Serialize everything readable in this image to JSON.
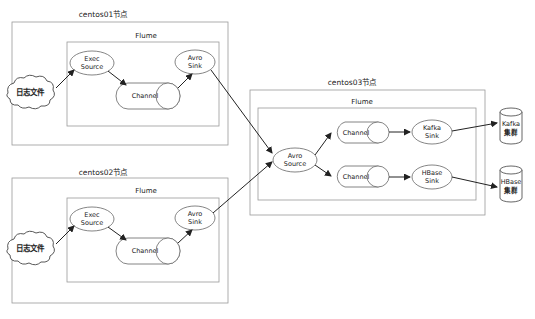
{
  "nodes": {
    "centos01": {
      "title": "centos01节点",
      "flume": "Flume",
      "log": "日志文件",
      "source": [
        "Exec",
        "Source"
      ],
      "channel": "Channel",
      "sink": [
        "Avro",
        "Sink"
      ]
    },
    "centos02": {
      "title": "centos02节点",
      "flume": "Flume",
      "log": "日志文件",
      "source": [
        "Exec",
        "Source"
      ],
      "channel": "Channel",
      "sink": [
        "Avro",
        "Sink"
      ]
    },
    "centos03": {
      "title": "centos03节点",
      "flume": "Flume",
      "source": [
        "Avro",
        "Source"
      ],
      "channel_top": "Channel",
      "channel_bottom": "Channel",
      "sink_top": [
        "Kafka",
        "Sink"
      ],
      "sink_bottom": [
        "HBase",
        "Sink"
      ]
    }
  },
  "targets": {
    "kafka": [
      "Kafka",
      "集群"
    ],
    "hbase": [
      "HBase",
      "集群"
    ]
  }
}
